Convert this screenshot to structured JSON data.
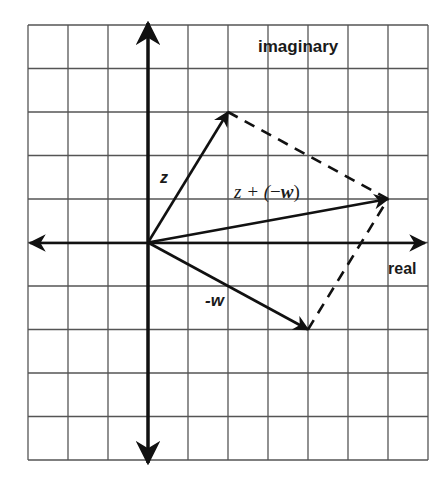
{
  "diagram": {
    "axes": {
      "imaginary_label": "imaginary",
      "real_label": "real"
    },
    "grid": {
      "columns": 10,
      "rows": 10,
      "origin_col": 3,
      "origin_row": 5,
      "color": "#555555"
    },
    "vectors": [
      {
        "id": "z",
        "label": "z",
        "from": [
          0,
          0
        ],
        "to": [
          2,
          3
        ],
        "style": "solid"
      },
      {
        "id": "neg-w",
        "label": "-w",
        "from": [
          0,
          0
        ],
        "to": [
          4,
          -2
        ],
        "style": "solid"
      },
      {
        "id": "sum",
        "label": "z + (−w)",
        "from": [
          0,
          0
        ],
        "to": [
          6,
          1
        ],
        "style": "solid"
      }
    ],
    "parallelogram_edges": [
      {
        "from": [
          2,
          3
        ],
        "to": [
          6,
          1
        ],
        "style": "dashed"
      },
      {
        "from": [
          4,
          -2
        ],
        "to": [
          6,
          1
        ],
        "style": "dashed"
      }
    ],
    "labels": {
      "z": "z",
      "neg_w": "-w",
      "sum_prefix": "z + (",
      "sum_minus": "−",
      "sum_w": "w",
      "sum_suffix": ")"
    }
  }
}
